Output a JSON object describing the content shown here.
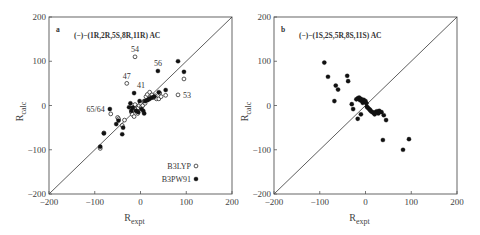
{
  "chart_data": [
    {
      "type": "scatter",
      "panel_label": "a",
      "title": "(−)−(1R,2R,5S,8R,11R) AC",
      "xlabel": "R",
      "xlabel_sub": "expt",
      "ylabel": "R",
      "ylabel_sub": "calc",
      "xlim": [
        -200,
        200
      ],
      "ylim": [
        -200,
        200
      ],
      "xticks": [
        "−200",
        "−100",
        "0",
        "100",
        "200"
      ],
      "yticks": [
        "−200",
        "−100",
        "0",
        "100",
        "200"
      ],
      "grid": false,
      "diagonal_line": true,
      "legend": [
        {
          "name": "B3LYP",
          "marker": "open-circle"
        },
        {
          "name": "B3PW91",
          "marker": "filled-circle"
        }
      ],
      "legend_position": "lower right",
      "annotations": [
        {
          "text": "54",
          "x": -12,
          "y": 110
        },
        {
          "text": "56",
          "x": 38,
          "y": 78
        },
        {
          "text": "47",
          "x": -30,
          "y": 49
        },
        {
          "text": "41",
          "x": -14,
          "y": 28
        },
        {
          "text": "53",
          "x": 82,
          "y": 24
        },
        {
          "text": "65/64",
          "x": -67,
          "y": -8
        }
      ],
      "series": [
        {
          "name": "B3LYP",
          "points": [
            [
              -12,
              110
            ],
            [
              -30,
              50
            ],
            [
              82,
              24
            ],
            [
              95,
              60
            ],
            [
              -65,
              -19
            ],
            [
              -88,
              -97
            ],
            [
              -80,
              -62
            ],
            [
              -50,
              -27
            ],
            [
              -48,
              -30
            ],
            [
              -40,
              -45
            ],
            [
              -35,
              -33
            ],
            [
              -20,
              -15
            ],
            [
              -15,
              -5
            ],
            [
              -12,
              2
            ],
            [
              -10,
              -8
            ],
            [
              -8,
              -12
            ],
            [
              -5,
              -5
            ],
            [
              -3,
              0
            ],
            [
              0,
              5
            ],
            [
              2,
              -4
            ],
            [
              5,
              0
            ],
            [
              8,
              10
            ],
            [
              10,
              5
            ],
            [
              12,
              20
            ],
            [
              15,
              25
            ],
            [
              18,
              14
            ],
            [
              20,
              30
            ],
            [
              22,
              18
            ],
            [
              25,
              24
            ],
            [
              28,
              18
            ],
            [
              32,
              22
            ],
            [
              35,
              15
            ],
            [
              40,
              15
            ],
            [
              42,
              28
            ],
            [
              45,
              20
            ],
            [
              55,
              23
            ],
            [
              -18,
              -20
            ],
            [
              -14,
              -25
            ],
            [
              -6,
              -18
            ]
          ],
          "marker": "open-circle"
        },
        {
          "name": "B3PW91",
          "points": [
            [
              38,
              78
            ],
            [
              -14,
              28
            ],
            [
              82,
              100
            ],
            [
              95,
              76
            ],
            [
              -67,
              -8
            ],
            [
              -88,
              -93
            ],
            [
              -80,
              -63
            ],
            [
              -53,
              -42
            ],
            [
              -48,
              -34
            ],
            [
              -38,
              -50
            ],
            [
              -40,
              -65
            ],
            [
              -25,
              -4
            ],
            [
              -22,
              5
            ],
            [
              -20,
              -12
            ],
            [
              -17,
              -5
            ],
            [
              -10,
              -12
            ],
            [
              -5,
              -15
            ],
            [
              -2,
              10
            ],
            [
              2,
              -8
            ],
            [
              6,
              -12
            ],
            [
              8,
              -18
            ],
            [
              10,
              10
            ],
            [
              15,
              12
            ],
            [
              20,
              15
            ],
            [
              25,
              18
            ],
            [
              30,
              20
            ],
            [
              40,
              30
            ],
            [
              55,
              35
            ]
          ],
          "marker": "filled-circle"
        }
      ]
    },
    {
      "type": "scatter",
      "panel_label": "b",
      "title": "(−)−(1S,2S,5R,8S,11S) AC",
      "xlabel": "R",
      "xlabel_sub": "expt",
      "ylabel": "R",
      "ylabel_sub": "calc",
      "xlim": [
        -200,
        200
      ],
      "ylim": [
        -200,
        200
      ],
      "xticks": [
        "−200",
        "−100",
        "0",
        "100",
        "200"
      ],
      "yticks": [
        "−200",
        "−100",
        "0",
        "100",
        "200"
      ],
      "grid": false,
      "diagonal_line": true,
      "series": [
        {
          "name": "B3PW91",
          "points": [
            [
              -90,
              97
            ],
            [
              -82,
              65
            ],
            [
              -65,
              45
            ],
            [
              -60,
              36
            ],
            [
              -40,
              67
            ],
            [
              -38,
              55
            ],
            [
              -68,
              10
            ],
            [
              -30,
              3
            ],
            [
              -27,
              -8
            ],
            [
              -20,
              14
            ],
            [
              -17,
              16
            ],
            [
              -14,
              18
            ],
            [
              -12,
              12
            ],
            [
              -10,
              15
            ],
            [
              -8,
              10
            ],
            [
              -6,
              6
            ],
            [
              -4,
              13
            ],
            [
              -2,
              8
            ],
            [
              0,
              10
            ],
            [
              2,
              5
            ],
            [
              3,
              -3
            ],
            [
              5,
              -5
            ],
            [
              8,
              -8
            ],
            [
              10,
              -10
            ],
            [
              12,
              -13
            ],
            [
              15,
              -15
            ],
            [
              18,
              -17
            ],
            [
              20,
              -20
            ],
            [
              22,
              -15
            ],
            [
              25,
              -13
            ],
            [
              28,
              -18
            ],
            [
              30,
              -12
            ],
            [
              35,
              -15
            ],
            [
              40,
              -22
            ],
            [
              45,
              -33
            ],
            [
              -17,
              -30
            ],
            [
              -10,
              -20
            ],
            [
              38,
              -78
            ],
            [
              82,
              -100
            ],
            [
              95,
              -76
            ]
          ],
          "marker": "filled-circle"
        }
      ]
    }
  ]
}
